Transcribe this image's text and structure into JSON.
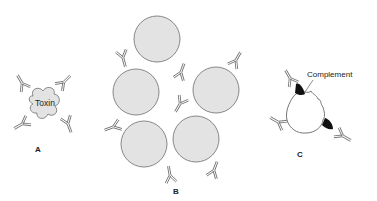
{
  "figure": {
    "panels": [
      {
        "id": "A",
        "label": "A",
        "object": "Toxin",
        "description": "Antibodies neutralizing a toxin"
      },
      {
        "id": "B",
        "label": "B",
        "description": "Antibodies agglutinating particles/cells"
      },
      {
        "id": "C",
        "label": "C",
        "annotation": "Complement",
        "description": "Antibodies activating complement on a cell surface"
      }
    ],
    "colors": {
      "cell_fill": "#e3e3e3",
      "outline": "#7a7a7a",
      "antibody": "#777777",
      "complement": "#111111"
    }
  }
}
